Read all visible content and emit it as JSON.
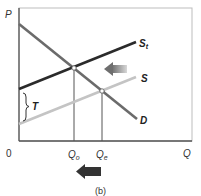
{
  "diagram": {
    "caption": "(b)",
    "axes": {
      "y_label": "P",
      "x_label": "Q",
      "origin_label": "0"
    },
    "curves": [
      {
        "name": "D",
        "label": "D",
        "color": "#6b6b6b"
      },
      {
        "name": "St",
        "label_main": "S",
        "label_sub": "t",
        "color": "#2b2b2b"
      },
      {
        "name": "S",
        "label": "S",
        "color": "#c4c4c4"
      }
    ],
    "tax_label": "T",
    "quantity_labels": {
      "q_o_main": "Q",
      "q_o_sub": "o",
      "q_e_main": "Q",
      "q_e_sub": "e"
    },
    "arrows": [
      {
        "name": "supply-shift-arrow",
        "direction": "left",
        "color": "#8a8a8a"
      },
      {
        "name": "quantity-decrease-arrow",
        "direction": "left",
        "color": "#333333"
      }
    ]
  }
}
